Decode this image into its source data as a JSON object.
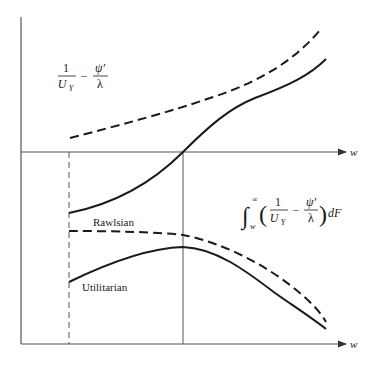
{
  "diagram": {
    "type": "economics-schedule-diagram",
    "top_panel": {
      "label": {
        "numerator": "1",
        "denominator": "U",
        "denominator_sub": "Y",
        "minus": "−",
        "numerator2": "ψ′",
        "denominator2": "λ"
      },
      "x_axis_label": "w",
      "curves": [
        {
          "name": "dashed-upper",
          "style": "dashed"
        },
        {
          "name": "solid-increasing",
          "style": "solid"
        }
      ]
    },
    "bottom_panel": {
      "label": {
        "integral": "∫",
        "upper_limit": "∞",
        "lower_limit": "w",
        "open_paren": "(",
        "numerator": "1",
        "denominator": "U",
        "denominator_sub": "Y",
        "minus": "−",
        "numerator2": "ψ′",
        "denominator2": "λ",
        "close_paren": ")",
        "dF": "dF"
      },
      "x_axis_label": "w",
      "curves": [
        {
          "name": "rawlsian",
          "label": "Rawlsian",
          "style": "dashed"
        },
        {
          "name": "utilitarian",
          "label": "Utilitarian",
          "style": "solid"
        }
      ]
    }
  }
}
